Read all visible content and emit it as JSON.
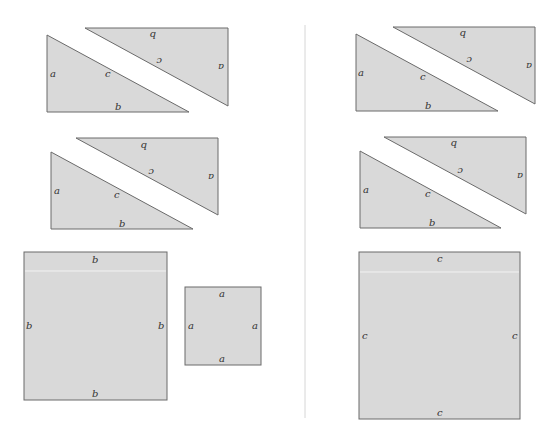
{
  "figure": {
    "left_panel": {
      "triangles": [
        {
          "id": "tri-1a",
          "labels": {
            "leg_vertical": "a",
            "leg_horizontal": "b",
            "hypotenuse": "c"
          }
        },
        {
          "id": "tri-1b",
          "labels": {
            "leg_vertical": "a",
            "leg_horizontal": "b",
            "hypotenuse": "c"
          },
          "rotated": true
        },
        {
          "id": "tri-2a",
          "labels": {
            "leg_vertical": "a",
            "leg_horizontal": "b",
            "hypotenuse": "c"
          }
        },
        {
          "id": "tri-2b",
          "labels": {
            "leg_vertical": "a",
            "leg_horizontal": "b",
            "hypotenuse": "c"
          },
          "rotated": true
        }
      ],
      "squares": [
        {
          "id": "square-b",
          "side_label": "b"
        },
        {
          "id": "square-a",
          "side_label": "a"
        }
      ]
    },
    "right_panel": {
      "triangles": [
        {
          "id": "tri-3a",
          "labels": {
            "leg_vertical": "a",
            "leg_horizontal": "b",
            "hypotenuse": "c"
          }
        },
        {
          "id": "tri-3b",
          "labels": {
            "leg_vertical": "a",
            "leg_horizontal": "b",
            "hypotenuse": "c"
          },
          "rotated": true
        },
        {
          "id": "tri-4a",
          "labels": {
            "leg_vertical": "a",
            "leg_horizontal": "b",
            "hypotenuse": "c"
          }
        },
        {
          "id": "tri-4b",
          "labels": {
            "leg_vertical": "a",
            "leg_horizontal": "b",
            "hypotenuse": "c"
          },
          "rotated": true
        }
      ],
      "squares": [
        {
          "id": "square-c",
          "side_label": "c"
        }
      ]
    },
    "colors": {
      "fill": "#d9d9d9",
      "stroke": "#6a6a6a",
      "divider": "#d6d6d6",
      "background": "#ffffff"
    }
  }
}
